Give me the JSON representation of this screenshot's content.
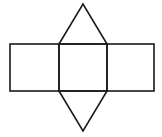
{
  "diagram": {
    "title": "",
    "stroke_color": "#1a1a1a",
    "background": "#ffffff",
    "shapes": [
      {
        "id": "rect-left",
        "type": "rectangle",
        "x": 10,
        "y": 44,
        "width": 49,
        "height": 47
      },
      {
        "id": "rect-middle",
        "type": "rectangle",
        "x": 59,
        "y": 44,
        "width": 48,
        "height": 47
      },
      {
        "id": "rect-right",
        "type": "rectangle",
        "x": 107,
        "y": 44,
        "width": 47,
        "height": 47
      },
      {
        "id": "triangle-top",
        "type": "triangle",
        "points": [
          [
            59,
            44
          ],
          [
            83,
            4
          ],
          [
            107,
            44
          ]
        ]
      },
      {
        "id": "triangle-bottom",
        "type": "triangle",
        "points": [
          [
            59,
            91
          ],
          [
            83,
            131
          ],
          [
            107,
            91
          ]
        ]
      }
    ]
  }
}
